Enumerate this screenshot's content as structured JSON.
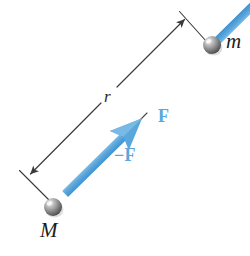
{
  "figure": {
    "type": "physics-free-body-diagram",
    "width": 250,
    "height": 256,
    "background_color": "#ffffff"
  },
  "colors": {
    "force_blue": "#5aa7dc",
    "force_blue_dark": "#3f92cf",
    "force_blue_light": "#86c1e8",
    "dimension_line": "#3a3a3a",
    "sphere_body": "#8e8e8e",
    "sphere_dark": "#4e4e4e",
    "sphere_highlight": "#e8e8e8",
    "label_text": "#1b1b1b",
    "force_label_text": "#5aa7dc"
  },
  "bodies": [
    {
      "id": "mass-m",
      "label": "m",
      "label_style": "italic-serif",
      "cx": 212,
      "cy": 45,
      "r": 9
    },
    {
      "id": "mass-M",
      "label": "M",
      "label_style": "italic-serif",
      "cx": 53,
      "cy": 207,
      "r": 9
    }
  ],
  "dimension": {
    "id": "separation-r",
    "label": "r",
    "label_style": "italic-serif",
    "description": "double-headed dimension arrow marking the separation between the two masses",
    "from": {
      "x": 29,
      "y": 175
    },
    "to": {
      "x": 184,
      "y": 18
    },
    "arrowheads": "both",
    "extension_lines": [
      {
        "x1": 48,
        "y1": 201,
        "x2": 20,
        "y2": 171
      },
      {
        "x1": 206,
        "y1": 42,
        "x2": 180,
        "y2": 12
      }
    ]
  },
  "vectors": [
    {
      "id": "force-F",
      "label": "F",
      "label_style": "bold-serif-blue",
      "description": "force on m directed toward M",
      "tail": {
        "x": 208,
        "y": 50
      },
      "tip": {
        "x": 143,
        "y": 114
      },
      "color": "#5aa7dc",
      "shaft_width": 8
    },
    {
      "id": "force-negative-F",
      "label": "−F",
      "label_style": "bold-serif-blue",
      "description": "reaction force on M directed toward m",
      "tail": {
        "x": 58,
        "y": 201
      },
      "tip": {
        "x": 118,
        "y": 142
      },
      "color": "#5aa7dc",
      "shaft_width": 8
    }
  ],
  "labels": {
    "mass_m": "m",
    "mass_M": "M",
    "separation": "r",
    "force": "F",
    "reaction_force": "−F"
  }
}
